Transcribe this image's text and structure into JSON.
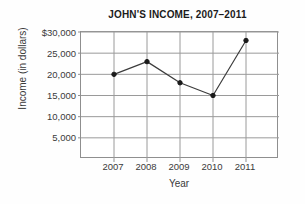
{
  "chart_data": {
    "type": "line",
    "title": "JOHN'S INCOME, 2007–2011",
    "xlabel": "Year",
    "ylabel": "Income (in dollars)",
    "categories": [
      "2007",
      "2008",
      "2009",
      "2010",
      "2011"
    ],
    "values": [
      20000,
      23000,
      18000,
      15000,
      28000
    ],
    "series": [
      {
        "name": "Income",
        "values": [
          20000,
          23000,
          18000,
          15000,
          28000
        ]
      }
    ],
    "xtick_labels": [
      "2007",
      "2008",
      "2009",
      "2010",
      "2011"
    ],
    "ytick_labels": [
      "$30,000",
      "25,000",
      "20,000",
      "15,000",
      "10,000",
      "5,000"
    ],
    "ytick_values": [
      30000,
      25000,
      20000,
      15000,
      10000,
      5000
    ],
    "ylim": [
      0,
      30000
    ],
    "grid": true,
    "legend": "none",
    "line_color": "#3c3c3c",
    "marker_color": "#1a1a1a",
    "grid_color": "#9a9a9a",
    "axis_color": "#8f8f8f",
    "background_color": "#ffffff"
  }
}
